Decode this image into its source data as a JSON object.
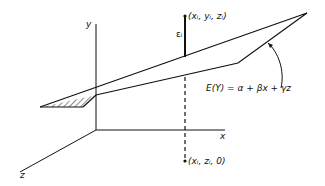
{
  "diagram": {
    "type": "3d-regression-plane",
    "axes": {
      "y_label": "y",
      "x_label": "x",
      "z_label": "z"
    },
    "points": {
      "observed": "(xᵢ, yᵢ, zᵢ)",
      "projection": "(xᵢ, zᵢ, 0)"
    },
    "error_label": "εᵢ",
    "plane_equation": "E(Y) = α + βx + γz"
  },
  "colors": {
    "line": "#111111",
    "background": "#ffffff"
  }
}
